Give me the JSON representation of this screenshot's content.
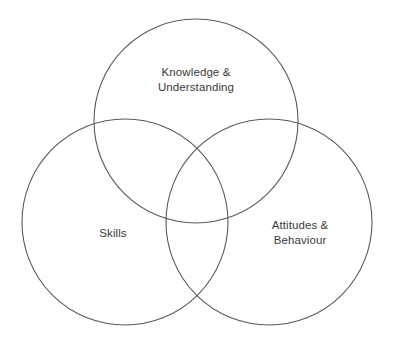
{
  "diagram": {
    "type": "venn-3-circle",
    "background_color": "#ffffff",
    "stroke_color": "#595959",
    "text_color": "#3a3a3a",
    "width": 393,
    "height": 349,
    "circles": [
      {
        "id": "knowledge",
        "label": "Knowledge &\nUnderstanding",
        "cx": 196,
        "cy": 121,
        "r": 102,
        "position": "top"
      },
      {
        "id": "skills",
        "label": "Skills",
        "cx": 125,
        "cy": 222,
        "r": 103,
        "position": "bottom-left"
      },
      {
        "id": "attitudes",
        "label": "Attitudes &\nBehaviour",
        "cx": 269,
        "cy": 222,
        "r": 103,
        "position": "bottom-right"
      }
    ]
  }
}
